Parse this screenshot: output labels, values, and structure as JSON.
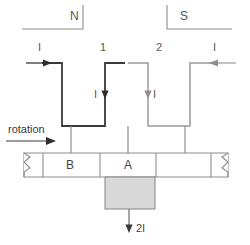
{
  "diagram": {
    "poles": [
      {
        "name": "north-pole",
        "label": "N"
      },
      {
        "name": "south-pole",
        "label": "S"
      }
    ],
    "coil_labels": [
      {
        "name": "coil-1-label",
        "label": "1"
      },
      {
        "name": "coil-2-label",
        "label": "2"
      }
    ],
    "current_labels": [
      {
        "name": "current-in-left",
        "label": "I"
      },
      {
        "name": "current-down-left",
        "label": "I"
      },
      {
        "name": "current-down-right",
        "label": "I"
      },
      {
        "name": "current-in-right",
        "label": "I"
      }
    ],
    "commutator": {
      "segments": [
        {
          "name": "segment-b",
          "label": "B"
        },
        {
          "name": "segment-a",
          "label": "A"
        }
      ]
    },
    "rotation": {
      "label": "rotation"
    },
    "brush": {
      "output_label": "2I"
    },
    "colors": {
      "coil_dark": "#3a3a3a",
      "coil_light": "#9a9a9a",
      "outline": "#8d8d8d",
      "brush_fill": "#d9d9d9",
      "text": "#4a4a4a",
      "background": "#ffffff"
    }
  }
}
